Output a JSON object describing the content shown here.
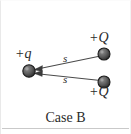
{
  "figure": {
    "caption": "Case B",
    "background_color": "#ffffff",
    "ink_color": "#3a3a3a",
    "charge_fill_color": "#6b6b6b",
    "charge_stroke_color": "#1f1f1f"
  },
  "charges": [
    {
      "id": "charge-left",
      "label": "+q",
      "sign": "+",
      "symbol": "q",
      "x": 28,
      "y": 70,
      "radius": 6
    },
    {
      "id": "charge-top-right",
      "label": "+Q",
      "sign": "+",
      "symbol": "Q",
      "x": 103,
      "y": 53,
      "radius": 6
    },
    {
      "id": "charge-bottom-right",
      "label": "+Q",
      "sign": "+",
      "symbol": "Q",
      "x": 103,
      "y": 81,
      "radius": 6
    }
  ],
  "vectors": [
    {
      "id": "vector-upper",
      "distance_label": "s",
      "from": "charge-top-right",
      "to": "charge-left",
      "arrow_at": "charge-left"
    },
    {
      "id": "vector-lower",
      "distance_label": "s",
      "from": "charge-bottom-right",
      "to": "charge-left",
      "arrow_at": "charge-left"
    }
  ],
  "labels": {
    "left_charge": "+q",
    "top_right_charge": "+Q",
    "bottom_right_charge": "+Q",
    "upper_distance": "s",
    "lower_distance": "s"
  }
}
